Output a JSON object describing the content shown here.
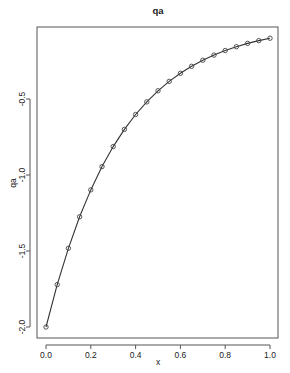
{
  "chart_data": {
    "type": "line",
    "title": "qa",
    "xlabel": "x",
    "ylabel": "qa",
    "xlim": [
      0,
      1
    ],
    "ylim": [
      -2.0,
      -0.1
    ],
    "xticks": [
      0.0,
      0.2,
      0.4,
      0.6,
      0.8,
      1.0
    ],
    "xtick_labels": [
      "0.0",
      "0.2",
      "0.4",
      "0.6",
      "0.8",
      "1.0"
    ],
    "yticks": [
      -2.0,
      -1.5,
      -1.0,
      -0.5
    ],
    "ytick_labels": [
      "-2.0",
      "-1.5",
      "-1.0",
      "-0.5"
    ],
    "grid": false,
    "legend": null,
    "marker": "open-circle",
    "line_style": "solid",
    "series": [
      {
        "name": "qa",
        "x": [
          0.0,
          0.05,
          0.1,
          0.15,
          0.2,
          0.25,
          0.3,
          0.35,
          0.4,
          0.45,
          0.5,
          0.55,
          0.6,
          0.65,
          0.7,
          0.75,
          0.8,
          0.85,
          0.9,
          0.95,
          1.0
        ],
        "values": [
          -2.0,
          -1.721,
          -1.482,
          -1.275,
          -1.098,
          -0.945,
          -0.813,
          -0.7,
          -0.602,
          -0.519,
          -0.446,
          -0.384,
          -0.331,
          -0.285,
          -0.245,
          -0.211,
          -0.181,
          -0.156,
          -0.134,
          -0.116,
          -0.1
        ]
      }
    ]
  },
  "colors": {
    "line": "#333333",
    "marker": "#444444",
    "axis": "#555555",
    "background": "#ffffff"
  }
}
